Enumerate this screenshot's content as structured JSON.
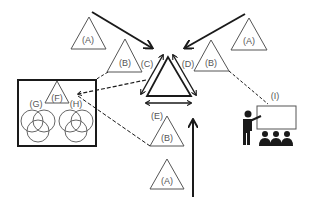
{
  "diagram": {
    "labels": {
      "A_topleft": "(A)",
      "A_topright": "(A)",
      "A_bottom": "(A)",
      "B_left": "(B)",
      "B_right": "(B)",
      "B_bottom": "(B)",
      "C": "(C)",
      "D": "(D)",
      "E": "(E)",
      "F": "(F)",
      "G": "(G)",
      "H": "(H)",
      "I": "(I)"
    },
    "colors": {
      "stroke": "#1a1a1a",
      "shape": "#555555",
      "background": "#ffffff"
    }
  }
}
